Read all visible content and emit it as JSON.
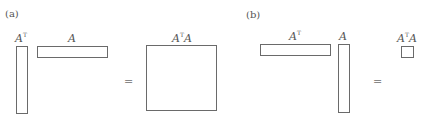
{
  "panels": [
    {
      "label": "(a)",
      "left": {
        "name": "A",
        "sup": "T"
      },
      "right": {
        "name": "A",
        "sup": ""
      },
      "equals": "=",
      "result": {
        "prefix": "A",
        "sup": "T",
        "suffix": "A"
      }
    },
    {
      "label": "(b)",
      "left": {
        "name": "A",
        "sup": "T"
      },
      "right": {
        "name": "A",
        "sup": ""
      },
      "equals": "=",
      "result": {
        "prefix": "A",
        "sup": "T",
        "suffix": "A"
      }
    }
  ]
}
